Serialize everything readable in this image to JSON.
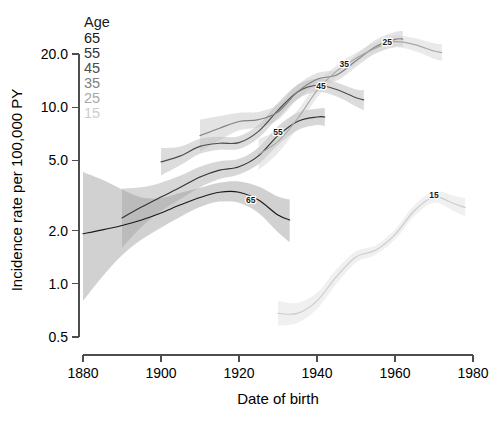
{
  "chart_data": {
    "type": "line",
    "title": "",
    "xlabel": "Date of birth",
    "ylabel": "Incidence rate per 100,000 PY",
    "xlim": [
      1880,
      1980
    ],
    "ylim": [
      0.5,
      20.0
    ],
    "yscale": "log",
    "grid": false,
    "xticks": [
      1880,
      1900,
      1920,
      1940,
      1960,
      1980
    ],
    "xticklabels": [
      "1880",
      "1900",
      "1920",
      "1940",
      "1960",
      "1980"
    ],
    "yticks": [
      0.5,
      1.0,
      2.0,
      5.0,
      10.0,
      20.0
    ],
    "yticklabels": [
      "0.5",
      "1.0",
      "2.0",
      "5.0",
      "10.0",
      "20.0"
    ],
    "legend_title": "Age",
    "legend_position": "top-left-inside",
    "legend_entries": [
      {
        "label": "65",
        "color": "#1a1a1a"
      },
      {
        "label": "55",
        "color": "#333333"
      },
      {
        "label": "45",
        "color": "#4d4d4d"
      },
      {
        "label": "35",
        "color": "#808080"
      },
      {
        "label": "25",
        "color": "#a8a8a8"
      },
      {
        "label": "15",
        "color": "#cccccc"
      }
    ],
    "band_description": "shaded 95% confidence bands in matching grey around each smoothed curve",
    "series": [
      {
        "name": "65",
        "label": "65",
        "color": "#1a1a1a",
        "band_color": "#9a9a9a",
        "band_opacity": 0.45,
        "annotation_x": 1923,
        "annotation_y": 2.85,
        "x": [
          1880,
          1885,
          1890,
          1895,
          1900,
          1905,
          1910,
          1915,
          1920,
          1925,
          1930,
          1933
        ],
        "y": [
          1.92,
          2.02,
          2.14,
          2.3,
          2.52,
          2.8,
          3.08,
          3.3,
          3.3,
          2.98,
          2.45,
          2.3
        ],
        "band_lo": [
          0.8,
          1.1,
          1.45,
          1.78,
          2.08,
          2.4,
          2.72,
          2.92,
          2.88,
          2.52,
          1.96,
          1.72
        ],
        "band_hi": [
          4.3,
          3.88,
          3.42,
          3.08,
          3.06,
          3.28,
          3.5,
          3.74,
          3.8,
          3.56,
          3.12,
          3.0
        ]
      },
      {
        "name": "55",
        "label": "55",
        "color": "#333333",
        "band_color": "#9a9a9a",
        "band_opacity": 0.4,
        "annotation_x": 1930,
        "annotation_y": 7.0,
        "x": [
          1890,
          1895,
          1900,
          1905,
          1910,
          1915,
          1920,
          1925,
          1930,
          1935,
          1940,
          1942
        ],
        "y": [
          2.36,
          2.72,
          3.1,
          3.52,
          4.02,
          4.4,
          4.6,
          5.3,
          6.9,
          8.3,
          8.8,
          8.8
        ],
        "band_lo": [
          1.6,
          2.1,
          2.58,
          3.02,
          3.52,
          3.92,
          4.16,
          4.76,
          6.1,
          7.4,
          7.92,
          7.8
        ],
        "band_hi": [
          3.46,
          3.52,
          3.74,
          4.1,
          4.6,
          4.94,
          5.1,
          5.92,
          7.8,
          9.3,
          9.8,
          9.9
        ]
      },
      {
        "name": "45",
        "label": "45",
        "color": "#4d4d4d",
        "band_color": "#a4a4a4",
        "band_opacity": 0.38,
        "annotation_x": 1941,
        "annotation_y": 12.6,
        "x": [
          1900,
          1905,
          1910,
          1915,
          1920,
          1925,
          1930,
          1935,
          1940,
          1945,
          1950,
          1952
        ],
        "y": [
          4.9,
          5.3,
          6.0,
          6.25,
          6.3,
          7.3,
          9.6,
          12.2,
          13.3,
          12.6,
          11.3,
          11.0
        ],
        "band_lo": [
          4.1,
          4.7,
          5.45,
          5.75,
          5.8,
          6.7,
          8.7,
          11.1,
          12.2,
          11.5,
          10.1,
          9.6
        ],
        "band_hi": [
          5.85,
          5.98,
          6.62,
          6.8,
          6.85,
          7.95,
          10.6,
          13.4,
          14.5,
          13.8,
          12.6,
          12.5
        ]
      },
      {
        "name": "35",
        "label": "35",
        "color": "#808080",
        "band_color": "#bdbdbd",
        "band_opacity": 0.42,
        "annotation_x": 1947,
        "annotation_y": 16.8,
        "x": [
          1910,
          1915,
          1920,
          1925,
          1930,
          1935,
          1940,
          1945,
          1950,
          1955,
          1960,
          1962
        ],
        "y": [
          6.9,
          7.6,
          8.3,
          8.5,
          9.4,
          12.2,
          14.4,
          15.2,
          18.3,
          22.0,
          24.2,
          24.3
        ],
        "band_lo": [
          5.6,
          6.5,
          7.4,
          7.7,
          8.5,
          11.1,
          13.3,
          14.1,
          16.9,
          20.2,
          22.0,
          21.8
        ],
        "band_hi": [
          8.5,
          8.9,
          9.3,
          9.4,
          10.4,
          13.4,
          15.6,
          16.4,
          19.8,
          24.0,
          26.6,
          27.0
        ]
      },
      {
        "name": "25",
        "label": "25",
        "color": "#a8a8a8",
        "band_color": "#d0d0d0",
        "band_opacity": 0.45,
        "annotation_x": 1958,
        "annotation_y": 22.5,
        "x": [
          1925,
          1930,
          1935,
          1940,
          1945,
          1950,
          1955,
          1960,
          1965,
          1970,
          1972
        ],
        "y": [
          5.4,
          6.4,
          8.6,
          12.4,
          16.0,
          18.9,
          21.6,
          23.5,
          22.6,
          20.8,
          20.4
        ],
        "band_lo": [
          4.4,
          5.5,
          7.7,
          11.3,
          14.8,
          17.6,
          20.1,
          21.8,
          20.8,
          18.8,
          18.3
        ],
        "band_hi": [
          6.6,
          7.45,
          9.6,
          13.6,
          17.3,
          20.3,
          23.2,
          25.3,
          24.6,
          23.0,
          22.8
        ]
      },
      {
        "name": "15",
        "label": "15",
        "color": "#cccccc",
        "band_color": "#e4e4e4",
        "band_opacity": 0.55,
        "annotation_x": 1970,
        "annotation_y": 3.05,
        "x": [
          1930,
          1935,
          1940,
          1945,
          1950,
          1955,
          1960,
          1965,
          1970,
          1975,
          1978
        ],
        "y": [
          0.68,
          0.68,
          0.8,
          1.1,
          1.42,
          1.55,
          1.9,
          2.6,
          3.1,
          2.85,
          2.7
        ],
        "band_lo": [
          0.58,
          0.6,
          0.72,
          1.0,
          1.32,
          1.46,
          1.78,
          2.42,
          2.88,
          2.58,
          2.4
        ],
        "band_hi": [
          0.8,
          0.78,
          0.89,
          1.21,
          1.53,
          1.65,
          2.03,
          2.79,
          3.34,
          3.15,
          3.05
        ]
      }
    ]
  }
}
